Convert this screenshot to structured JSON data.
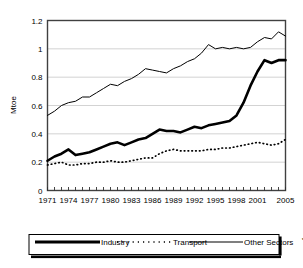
{
  "chart_data": {
    "type": "line",
    "title": "",
    "xlabel": "",
    "ylabel": "Mtoe",
    "ylim": [
      0,
      1.2
    ],
    "yticks": [
      "0",
      "0.2",
      "0.4",
      "0.6",
      "0.8",
      "1",
      "1.2"
    ],
    "ytick_values": [
      0,
      0.2,
      0.4,
      0.6,
      0.8,
      1,
      1.2
    ],
    "grid": true,
    "grid_axis": "y",
    "legend_position": "bottom",
    "xlim": [
      1971,
      2005
    ],
    "x": [
      1971,
      1972,
      1973,
      1974,
      1975,
      1976,
      1977,
      1978,
      1979,
      1980,
      1981,
      1982,
      1983,
      1984,
      1985,
      1986,
      1987,
      1988,
      1989,
      1990,
      1991,
      1992,
      1993,
      1994,
      1995,
      1996,
      1997,
      1998,
      1999,
      2000,
      2001,
      2002,
      2003,
      2004,
      2005
    ],
    "xticklabels": [
      "1971",
      "1974",
      "1977",
      "1980",
      "1983",
      "1986",
      "1989",
      "1992",
      "1995",
      "1998",
      "2001",
      "2005"
    ],
    "xticklabel_values": [
      1971,
      1974,
      1977,
      1980,
      1983,
      1986,
      1989,
      1992,
      1995,
      1998,
      2001,
      2005
    ],
    "series": [
      {
        "name": "Industry",
        "style": "thick-solid",
        "color": "#000000",
        "values": [
          0.21,
          0.24,
          0.26,
          0.29,
          0.25,
          0.26,
          0.27,
          0.29,
          0.31,
          0.33,
          0.34,
          0.32,
          0.34,
          0.36,
          0.37,
          0.4,
          0.43,
          0.42,
          0.42,
          0.41,
          0.43,
          0.45,
          0.44,
          0.46,
          0.47,
          0.48,
          0.49,
          0.53,
          0.62,
          0.74,
          0.84,
          0.92,
          0.9,
          0.92,
          0.92
        ]
      },
      {
        "name": "Transport",
        "style": "dotted",
        "color": "#000000",
        "values": [
          0.18,
          0.19,
          0.2,
          0.18,
          0.18,
          0.19,
          0.19,
          0.2,
          0.2,
          0.21,
          0.2,
          0.2,
          0.21,
          0.22,
          0.23,
          0.23,
          0.26,
          0.28,
          0.29,
          0.28,
          0.28,
          0.28,
          0.28,
          0.29,
          0.29,
          0.3,
          0.3,
          0.31,
          0.32,
          0.33,
          0.34,
          0.33,
          0.32,
          0.33,
          0.36
        ]
      },
      {
        "name": "Other Sectors",
        "name_suffix": "****",
        "style": "thin-solid",
        "color": "#000000",
        "values": [
          0.53,
          0.56,
          0.6,
          0.62,
          0.63,
          0.66,
          0.66,
          0.69,
          0.72,
          0.75,
          0.74,
          0.77,
          0.79,
          0.82,
          0.86,
          0.85,
          0.84,
          0.83,
          0.86,
          0.88,
          0.91,
          0.93,
          0.97,
          1.03,
          1.0,
          1.01,
          1.0,
          1.01,
          1.0,
          1.01,
          1.05,
          1.08,
          1.07,
          1.12,
          1.09
        ]
      }
    ]
  },
  "legend": {
    "items": [
      {
        "label": "Industry",
        "suffix": "",
        "marker": "thick-solid"
      },
      {
        "label": "Transport",
        "suffix": "",
        "marker": "dotted"
      },
      {
        "label": "Other Sectors",
        "suffix": "****",
        "marker": "thin-solid"
      }
    ]
  }
}
